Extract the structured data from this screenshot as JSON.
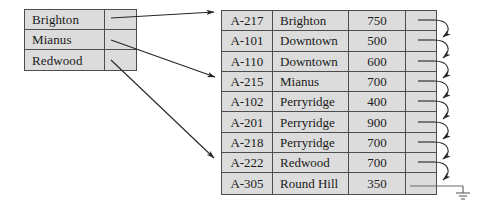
{
  "diagram": {
    "colors": {
      "cell_fill": "#dcdcdc",
      "border": "#4d4d4d",
      "arrow": "#262626",
      "background": "#ffffff"
    },
    "index_table": {
      "name": "search-key-index",
      "rows": [
        {
          "key": "Brighton",
          "pointer": "",
          "target_row": 0
        },
        {
          "key": "Mianus",
          "pointer": "",
          "target_row": 3
        },
        {
          "key": "Redwood",
          "pointer": "",
          "target_row": 7
        }
      ]
    },
    "file_table": {
      "name": "account-file",
      "rows": [
        {
          "account": "A-217",
          "branch": "Brighton",
          "balance": "750",
          "pointer": ""
        },
        {
          "account": "A-101",
          "branch": "Downtown",
          "balance": "500",
          "pointer": ""
        },
        {
          "account": "A-110",
          "branch": "Downtown",
          "balance": "600",
          "pointer": ""
        },
        {
          "account": "A-215",
          "branch": "Mianus",
          "balance": "700",
          "pointer": ""
        },
        {
          "account": "A-102",
          "branch": "Perryridge",
          "balance": "400",
          "pointer": ""
        },
        {
          "account": "A-201",
          "branch": "Perryridge",
          "balance": "900",
          "pointer": ""
        },
        {
          "account": "A-218",
          "branch": "Perryridge",
          "balance": "700",
          "pointer": ""
        },
        {
          "account": "A-222",
          "branch": "Redwood",
          "balance": "700",
          "pointer": ""
        },
        {
          "account": "A-305",
          "branch": "Round Hill",
          "balance": "350",
          "pointer": ""
        }
      ]
    },
    "null_pointer_symbol": "ground"
  }
}
